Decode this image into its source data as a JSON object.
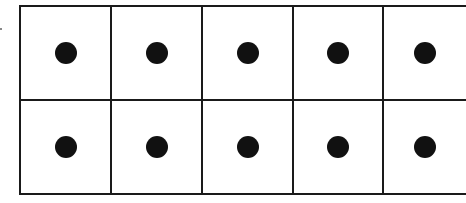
{
  "diagram": {
    "type": "ten-frame",
    "rows": 2,
    "columns": 5,
    "filled_count": 10,
    "cells": [
      {
        "row": 1,
        "col": 1,
        "filled": true
      },
      {
        "row": 1,
        "col": 2,
        "filled": true
      },
      {
        "row": 1,
        "col": 3,
        "filled": true
      },
      {
        "row": 1,
        "col": 4,
        "filled": true
      },
      {
        "row": 1,
        "col": 5,
        "filled": true
      },
      {
        "row": 2,
        "col": 1,
        "filled": true
      },
      {
        "row": 2,
        "col": 2,
        "filled": true
      },
      {
        "row": 2,
        "col": 3,
        "filled": true
      },
      {
        "row": 2,
        "col": 4,
        "filled": true
      },
      {
        "row": 2,
        "col": 5,
        "filled": true
      }
    ],
    "colors": {
      "line": "#1a1a1a",
      "dot": "#111111",
      "background": "#ffffff"
    }
  }
}
